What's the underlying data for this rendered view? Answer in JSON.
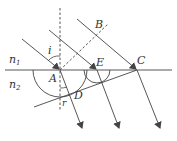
{
  "diagram": {
    "type": "refraction-wavefront",
    "labels": {
      "n1": "n",
      "n1_sub": "1",
      "n2": "n",
      "n2_sub": "2",
      "A": "A",
      "B": "B",
      "C": "C",
      "D": "D",
      "E": "E",
      "i": "i",
      "r": "r"
    },
    "colors": {
      "line": "#444444",
      "text": "#333333"
    }
  }
}
